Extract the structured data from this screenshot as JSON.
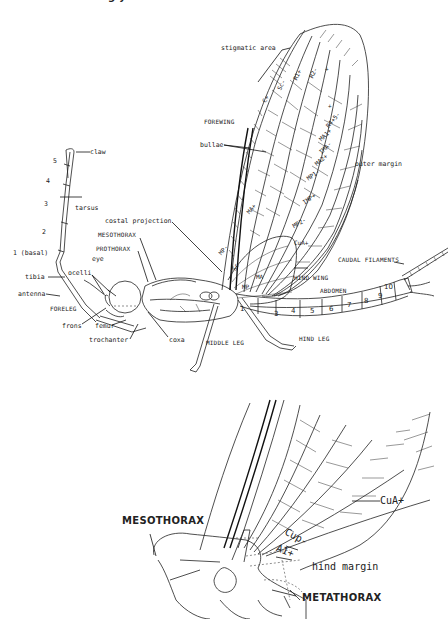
{
  "header": {
    "cropped_caption": "g                     y"
  },
  "main_figure": {
    "title": "Mayfly (Ephemeroptera) external anatomy — lateral view",
    "labels": {
      "stigmatic_area": "stigmatic area",
      "forewing": "FOREWING",
      "bullae": "bullae",
      "outer_margin": "outer margin",
      "claw": "claw",
      "tarsus": "tarsus",
      "tarsal_segments": [
        "5",
        "4",
        "3",
        "2",
        "1 (basal)"
      ],
      "tibia": "tibia",
      "ocelli": "ocelli",
      "eye": "eye",
      "antenna": "antenna",
      "foreleg": "FORELEG",
      "frons": "frons",
      "femur": "femur",
      "trochanter": "trochanter",
      "coxa": "coxa",
      "costal_projection": "costal projection",
      "mesothorax": "MESOTHORAX",
      "prothorax": "PROTHORAX",
      "middle_leg": "MIDDLE LEG",
      "hind_leg": "HIND LEG",
      "hind_wing": "HIND WING",
      "abdomen": "ABDOMEN",
      "caudal_filaments": "CAUDAL FILAMENTS"
    },
    "vein_labels": [
      "C+",
      "Sc-",
      "R1+",
      "R2-",
      "+",
      "+",
      "R4+5-",
      "MA1+",
      "IMA-",
      "MA2+",
      "MP1-",
      "IMP+",
      "MP2-",
      "CuA+",
      "MA+",
      "MP-",
      "Sc",
      "MA",
      "MP"
    ],
    "abdominal_segments": [
      "1",
      "3",
      "4",
      "5",
      "6",
      "7",
      "8",
      "9",
      "10"
    ]
  },
  "detail_figure": {
    "title": "Enlarged thorax and wing base",
    "labels": {
      "mesothorax": "MESOTHORAX",
      "cua": "CuA+",
      "cup": "Cup-",
      "a1": "A1+",
      "hind_margin": "hind margin",
      "metathorax": "METATHORAX"
    }
  }
}
